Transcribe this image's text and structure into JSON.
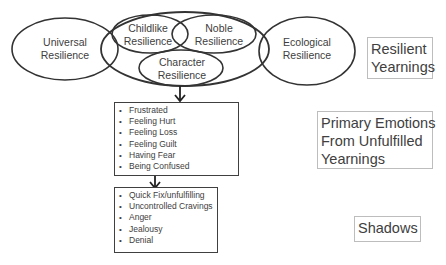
{
  "ellipses": {
    "universal": {
      "line1": "Universal",
      "line2": "Resilience"
    },
    "childlike": {
      "line1": "Childlike",
      "line2": "Resilience"
    },
    "noble": {
      "line1": "Noble",
      "line2": "Resilience"
    },
    "character": {
      "line1": "Character",
      "line2": "Resilience"
    },
    "ecological": {
      "line1": "Ecological",
      "line2": "Resilience"
    }
  },
  "emotions_box": {
    "items": [
      "Frustrated",
      "Feeling Hurt",
      "Feeling Loss",
      "Feeling Guilt",
      "Having Fear",
      "Being Confused"
    ]
  },
  "shadows_box": {
    "items": [
      "Quick Fix/unfulfilling",
      "Uncontrolled Cravings",
      "Anger",
      "Jealousy",
      "Denial"
    ]
  },
  "side_labels": {
    "resilient_yearnings": {
      "line1": "Resilient",
      "line2": "Yearnings"
    },
    "primary_emotions": {
      "line1": "Primary Emotions",
      "line2": "From Unfulfilled",
      "line3": "Yearnings"
    },
    "shadows": {
      "line1": "Shadows"
    }
  },
  "colors": {
    "stroke": "#333333",
    "text": "#404040",
    "label_border": "#bdbdbd"
  }
}
